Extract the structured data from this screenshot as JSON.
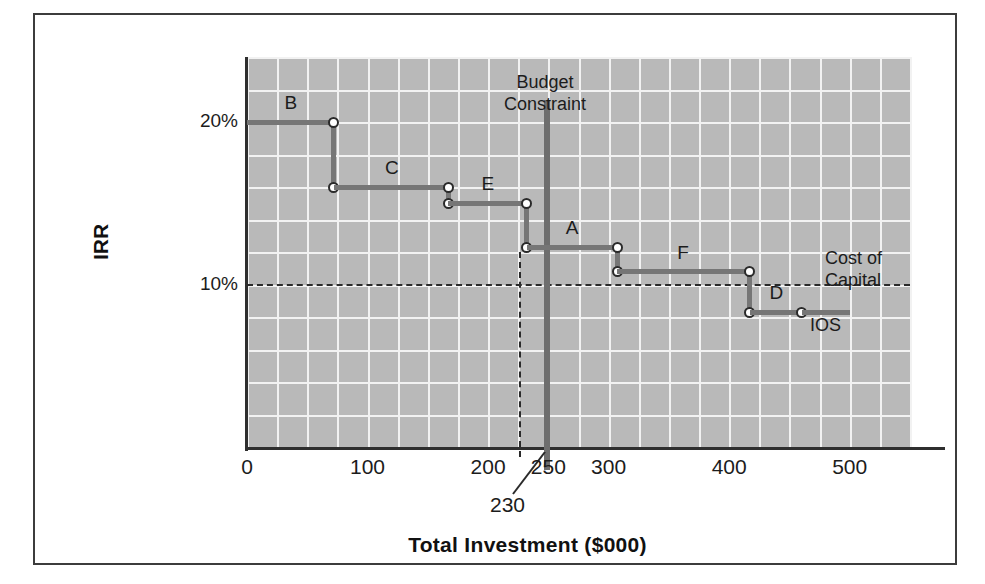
{
  "chart_data": {
    "type": "line",
    "subtype": "step",
    "title": "",
    "xlabel": "Total Investment ($000)",
    "ylabel": "IRR",
    "xlim": [
      0,
      550
    ],
    "ylim": [
      0,
      24
    ],
    "grid": true,
    "legend": "none",
    "x_ticks": [
      {
        "value": 0,
        "label": "0"
      },
      {
        "value": 100,
        "label": "100"
      },
      {
        "value": 200,
        "label": "200"
      },
      {
        "value": 250,
        "label": "250"
      },
      {
        "value": 300,
        "label": "300"
      },
      {
        "value": 400,
        "label": "400"
      },
      {
        "value": 500,
        "label": "500"
      }
    ],
    "y_ticks": [
      {
        "value": 20,
        "label": "20%"
      },
      {
        "value": 10,
        "label": "10%"
      }
    ],
    "series_name": "IOS",
    "steps": [
      {
        "project": "B",
        "x_start": 0,
        "x_end": 72,
        "irr": 20.0
      },
      {
        "project": "C",
        "x_start": 72,
        "x_end": 167,
        "irr": 16.0
      },
      {
        "project": "E",
        "x_start": 167,
        "x_end": 232,
        "irr": 15.0
      },
      {
        "project": "A",
        "x_start": 232,
        "x_end": 307,
        "irr": 12.3
      },
      {
        "project": "F",
        "x_start": 307,
        "x_end": 417,
        "irr": 10.8
      },
      {
        "project": "D",
        "x_start": 417,
        "x_end": 460,
        "irr": 8.3
      }
    ],
    "annotations": {
      "budget_constraint": {
        "label": "Budget\nConstraint",
        "label_line1": "Budget",
        "label_line2": "Constraint",
        "x_value": 250
      },
      "cost_of_capital": {
        "label_line1": "Cost of",
        "label_line2": "Capital",
        "y_value": 10.0,
        "style": "dashed"
      },
      "ios_curve_label": "IOS",
      "accepted_investment": {
        "label": "230",
        "x_value": 230,
        "style": "dashed-drop-line"
      }
    },
    "colors": {
      "plot_background": "#b9b9b9",
      "gridline": "#f2f2f2",
      "step_line": "#767676",
      "budget_line": "#6e6e6e",
      "axis": "#2f2f2f",
      "text": "#1c1c1c",
      "frame": "#3c3c3c"
    }
  }
}
